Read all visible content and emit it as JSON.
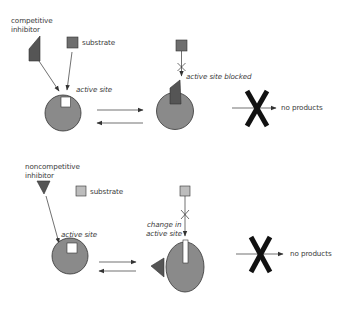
{
  "colors": {
    "enzyme_fill": "#8a8a8a",
    "enzyme_stroke": "#3a3a3a",
    "inhibitor_fill": "#555555",
    "substrate_dark": "#6e6e6e",
    "substrate_light": "#bdbdbd",
    "block_x": "#111111",
    "line": "#333333",
    "text": "#3a3a3a"
  },
  "panels": [
    {
      "id": "competitive",
      "inhibitor_label_line1": "competitive",
      "inhibitor_label_line2": "inhibitor",
      "substrate_label": "substrate",
      "active_site_label": "active site",
      "blocked_label": "active site blocked",
      "result_label": "no products"
    },
    {
      "id": "noncompetitive",
      "inhibitor_label_line1": "noncompetitive",
      "inhibitor_label_line2": "inhibitor",
      "substrate_label": "substrate",
      "active_site_label": "active site",
      "change_label_line1": "change in",
      "change_label_line2": "active site",
      "result_label": "no products"
    }
  ]
}
